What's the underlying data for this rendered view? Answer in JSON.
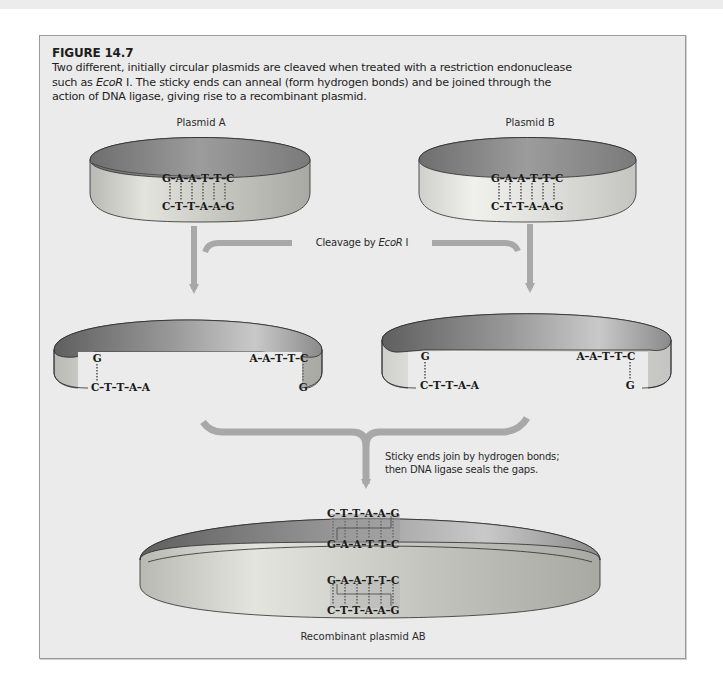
{
  "figure": {
    "title": "FIGURE 14.7",
    "caption_part1": "Two different, initially circular plasmids are cleaved when treated with a restriction endonuclease such as ",
    "caption_enzyme": "EcoR",
    "caption_part2": " I. The sticky ends can anneal (form hydrogen bonds) and be joined through the action of DNA ligase, giving rise to a recombinant plasmid."
  },
  "plasmids": {
    "a": {
      "label": "Plasmid A",
      "top_strand": "G–A–A–T–T–C",
      "bottom_strand": "C–T–T–A–A–G"
    },
    "b": {
      "label": "Plasmid B",
      "top_strand": "G–A–A–T–T–C",
      "bottom_strand": "C–T–T–A–A–G"
    }
  },
  "cleavage": {
    "label_prefix": "Cleavage by ",
    "enzyme": "EcoR",
    "suffix": " I"
  },
  "cleaved": {
    "a": {
      "left_top": "G",
      "left_bottom": "C–T–T–A–A",
      "right_top": "A–A–T–T–C",
      "right_bottom": "G"
    },
    "b": {
      "left_top": "G",
      "left_bottom": "C–T–T–A–A",
      "right_top": "A–A–T–T–C",
      "right_bottom": "G"
    }
  },
  "joining": {
    "note_line1": "Sticky ends join by hydrogen bonds;",
    "note_line2": "then DNA ligase seals the gaps."
  },
  "recombinant": {
    "label": "Recombinant plasmid AB",
    "back_top": "C–T–T–A–A–G",
    "back_bottom": "G–A–A–T–T–C",
    "front_top": "G–A–A–T–T–C",
    "front_bottom": "C–T–T–A–A–G"
  },
  "colors": {
    "frame_bg": "#ebebeb",
    "arrow": "#a8a8a8",
    "band_outer": "#d6d6d2",
    "band_inner": "#8c8c8c",
    "text": "#1e1e1e"
  }
}
